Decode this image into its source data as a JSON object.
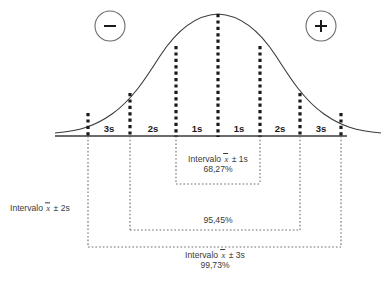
{
  "figure": {
    "language": "pt-BR",
    "background": "#ffffff",
    "ink_color": "#2b2b2b"
  },
  "sign_markers": {
    "negative": {
      "symbol": "−",
      "name": "minus-sign",
      "cx": 110,
      "cy": 26,
      "r": 15
    },
    "positive": {
      "symbol": "+",
      "name": "plus-sign",
      "cx": 321,
      "cy": 26,
      "r": 15
    }
  },
  "axis": {
    "x_start": 55,
    "x_end": 347,
    "y": 136,
    "color": "#3a3a3a"
  },
  "curve": {
    "peak_x": 218,
    "peak_y": 14,
    "baseline_y": 136,
    "left_end_x": 55,
    "right_end_x": 347,
    "color": "#3a3a3a"
  },
  "sigma_lines": [
    {
      "label": "-3s",
      "x": 88,
      "top_y": 113
    },
    {
      "label": "-2s",
      "x": 130,
      "top_y": 93
    },
    {
      "label": "-1s",
      "x": 176,
      "top_y": 46
    },
    {
      "label": "0",
      "x": 218,
      "top_y": 14
    },
    {
      "label": "+1s",
      "x": 260,
      "top_y": 46
    },
    {
      "label": "+2s",
      "x": 300,
      "top_y": 93
    },
    {
      "label": "+3s",
      "x": 341,
      "top_y": 113
    }
  ],
  "band_labels": [
    {
      "text": "3s",
      "x": 109,
      "y": 130
    },
    {
      "text": "2s",
      "x": 153,
      "y": 130
    },
    {
      "text": "1s",
      "x": 197,
      "y": 130
    },
    {
      "text": "1s",
      "x": 239,
      "y": 130
    },
    {
      "text": "2s",
      "x": 280,
      "y": 130
    },
    {
      "text": "3s",
      "x": 321,
      "y": 130
    }
  ],
  "brackets": [
    {
      "name": "interval-1s",
      "left_x": 176,
      "right_x": 260,
      "bottom_y": 184,
      "interval_prefix": "Intervalo ",
      "interval_var": "x",
      "interval_suffix": " ± 1s",
      "percent": "68,27%",
      "caption_x": 218,
      "caption_y": 155,
      "caption_position": "inside"
    },
    {
      "name": "interval-2s",
      "left_x": 130,
      "right_x": 300,
      "bottom_y": 230,
      "interval_prefix": "Intervalo ",
      "interval_var": "x",
      "interval_suffix": " ± 2s",
      "percent": "95,45%",
      "caption_x": 23,
      "caption_y": 209,
      "percent_x": 218,
      "percent_y": 216,
      "caption_position": "left"
    },
    {
      "name": "interval-3s",
      "left_x": 88,
      "right_x": 341,
      "bottom_y": 247,
      "interval_prefix": "Intervalo ",
      "interval_var": "x",
      "interval_suffix": " ± 3s",
      "percent": "99,73%",
      "caption_x": 215,
      "caption_y": 251,
      "caption_position": "below"
    }
  ]
}
